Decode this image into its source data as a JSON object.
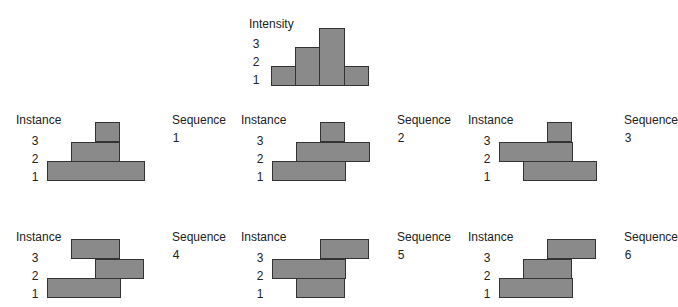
{
  "intensity": {
    "title": "Intensity",
    "y_labels": [
      "3",
      "2",
      "1"
    ]
  },
  "panels": [
    {
      "instance_label": "Instance",
      "sequence_label": "Sequence",
      "sequence_number": "1",
      "row_labels": [
        "3",
        "2",
        "1"
      ]
    },
    {
      "instance_label": "Instance",
      "sequence_label": "Sequence",
      "sequence_number": "2",
      "row_labels": [
        "3",
        "2",
        "1"
      ]
    },
    {
      "instance_label": "Instance",
      "sequence_label": "Sequence",
      "sequence_number": "3",
      "row_labels": [
        "3",
        "2",
        "1"
      ]
    },
    {
      "instance_label": "Instance",
      "sequence_label": "Sequence",
      "sequence_number": "4",
      "row_labels": [
        "3",
        "2",
        "1"
      ]
    },
    {
      "instance_label": "Instance",
      "sequence_label": "Sequence",
      "sequence_number": "5",
      "row_labels": [
        "3",
        "2",
        "1"
      ]
    },
    {
      "instance_label": "Instance",
      "sequence_label": "Sequence",
      "sequence_number": "6",
      "row_labels": [
        "3",
        "2",
        "1"
      ]
    }
  ],
  "chart_data": [
    {
      "type": "bar",
      "title": "Intensity",
      "categories": [
        "c1",
        "c2",
        "c3",
        "c4"
      ],
      "values": [
        1,
        2,
        3,
        1
      ],
      "ylabel": "Intensity",
      "ylim": [
        0,
        3
      ]
    },
    {
      "type": "gantt-like",
      "description": "Six sequences; each instance (row 1-3) spans a range of the 4 intensity columns [start, end)",
      "sequences": [
        {
          "sequence": 1,
          "instances": {
            "1": [
              0,
              4
            ],
            "2": [
              1,
              3
            ],
            "3": [
              2,
              3
            ]
          }
        },
        {
          "sequence": 2,
          "instances": {
            "1": [
              0,
              3
            ],
            "2": [
              1,
              4
            ],
            "3": [
              2,
              3
            ]
          }
        },
        {
          "sequence": 3,
          "instances": {
            "1": [
              1,
              4
            ],
            "2": [
              0,
              3
            ],
            "3": [
              2,
              3
            ]
          }
        },
        {
          "sequence": 4,
          "instances": {
            "1": [
              0,
              3
            ],
            "2": [
              2,
              4
            ],
            "3": [
              1,
              3
            ]
          }
        },
        {
          "sequence": 5,
          "instances": {
            "1": [
              1,
              3
            ],
            "2": [
              0,
              3
            ],
            "3": [
              2,
              4
            ]
          }
        },
        {
          "sequence": 6,
          "instances": {
            "1": [
              0,
              3
            ],
            "2": [
              1,
              3
            ],
            "3": [
              2,
              4
            ]
          }
        }
      ]
    }
  ]
}
